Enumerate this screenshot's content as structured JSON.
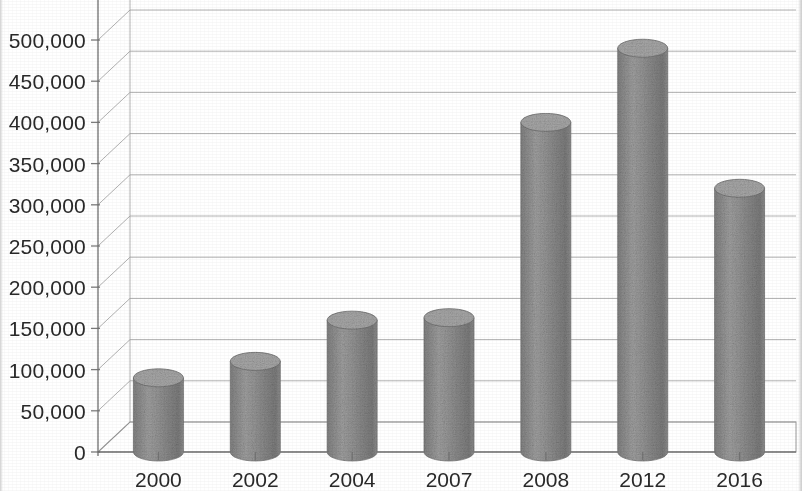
{
  "chart_data": {
    "type": "bar",
    "title": "",
    "subtitle": "",
    "xlabel": "",
    "ylabel": "",
    "categories": [
      "2000",
      "2002",
      "2004",
      "2007",
      "2008",
      "2012",
      "2016"
    ],
    "values": [
      90000,
      110000,
      160000,
      163000,
      400000,
      490000,
      320000
    ],
    "series": [
      {
        "name": "",
        "values": [
          90000,
          110000,
          160000,
          163000,
          400000,
          490000,
          320000
        ]
      }
    ],
    "ylim": [
      0,
      550000
    ],
    "ytick_values": [
      0,
      50000,
      100000,
      150000,
      200000,
      250000,
      300000,
      350000,
      400000,
      450000,
      500000
    ],
    "ytick_labels": [
      "0",
      "50,000",
      "100,000",
      "150,000",
      "200,000",
      "250,000",
      "300,000",
      "350,000",
      "400,000",
      "450,000",
      "500,000"
    ],
    "xtick_labels": [
      "2000",
      "2002",
      "2004",
      "2007",
      "2008",
      "2012",
      "2016"
    ],
    "grid": true,
    "grid_axis": "y",
    "legend": false,
    "legend_position": "none",
    "style": "3d-cylinder",
    "bar_color": "#8a8a8a",
    "bar_top_color": "#a7a7a7",
    "gridline_color": "#9a9a9a",
    "axis_color": "#6f6f6f",
    "text_color": "#2b2b2b",
    "background_color": "#fdfdfd",
    "annotations": []
  },
  "axis": {
    "y_ticks": [
      {
        "label": "500,000",
        "value": 500000
      },
      {
        "label": "450,000",
        "value": 450000
      },
      {
        "label": "400,000",
        "value": 400000
      },
      {
        "label": "350,000",
        "value": 350000
      },
      {
        "label": "300,000",
        "value": 300000
      },
      {
        "label": "250,000",
        "value": 250000
      },
      {
        "label": "200,000",
        "value": 200000
      },
      {
        "label": "150,000",
        "value": 150000
      },
      {
        "label": "100,000",
        "value": 100000
      },
      {
        "label": "50,000",
        "value": 50000
      },
      {
        "label": "0",
        "value": 0
      }
    ],
    "x_ticks": [
      {
        "label": "2000"
      },
      {
        "label": "2002"
      },
      {
        "label": "2004"
      },
      {
        "label": "2007"
      },
      {
        "label": "2008"
      },
      {
        "label": "2012"
      },
      {
        "label": "2016"
      }
    ]
  }
}
